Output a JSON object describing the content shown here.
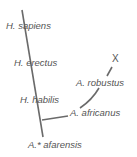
{
  "diagram": {
    "type": "hominin-phylogeny",
    "labels": {
      "sapiens": "H. sapiens",
      "erectus": "H. erectus",
      "habilis": "H. habilis",
      "afarensis": "A.* afarensis",
      "africanus": "A. africanus",
      "robustus": "A. robustus",
      "extinct_mark": "X"
    },
    "line_color": "#6a6a6a"
  }
}
